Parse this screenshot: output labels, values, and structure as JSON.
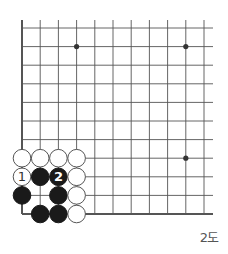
{
  "diagram": {
    "type": "go-board-diagram",
    "caption": "2도",
    "grid": {
      "columns": 11,
      "rows": 11,
      "x_start": 22,
      "x_step": 18.2,
      "y_start": 28,
      "y_step": 18.6,
      "left_edge_bold": true,
      "bottom_edge_bold": true,
      "line_color": "#555555"
    },
    "star_points": [
      {
        "col": 3,
        "row": 1
      },
      {
        "col": 9,
        "row": 1
      },
      {
        "col": 9,
        "row": 7
      }
    ],
    "stones": [
      {
        "col": 0,
        "row": 7,
        "color": "white"
      },
      {
        "col": 1,
        "row": 7,
        "color": "white"
      },
      {
        "col": 2,
        "row": 7,
        "color": "white"
      },
      {
        "col": 3,
        "row": 7,
        "color": "white"
      },
      {
        "col": 0,
        "row": 8,
        "color": "white",
        "label": "1"
      },
      {
        "col": 1,
        "row": 8,
        "color": "black"
      },
      {
        "col": 2,
        "row": 8,
        "color": "black",
        "label": "2"
      },
      {
        "col": 3,
        "row": 8,
        "color": "white"
      },
      {
        "col": 0,
        "row": 9,
        "color": "black"
      },
      {
        "col": 2,
        "row": 9,
        "color": "black"
      },
      {
        "col": 3,
        "row": 9,
        "color": "white"
      },
      {
        "col": 1,
        "row": 10,
        "color": "black"
      },
      {
        "col": 2,
        "row": 10,
        "color": "black"
      },
      {
        "col": 3,
        "row": 10,
        "color": "white"
      }
    ],
    "colors": {
      "black_stone": "#1a1a1a",
      "white_stone": "#ffffff",
      "stone_outline": "#555555"
    }
  }
}
